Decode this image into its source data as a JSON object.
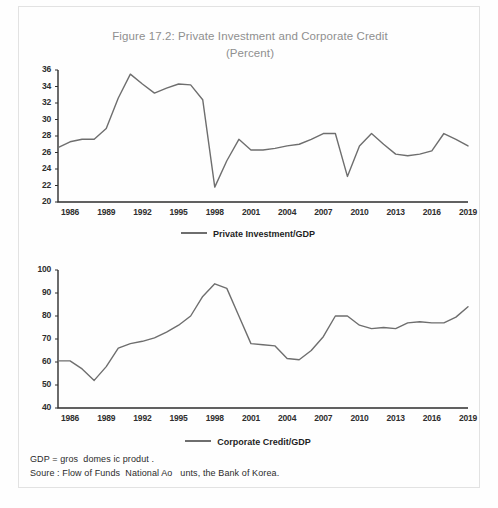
{
  "figure": {
    "title_line1": "Figure 17.2: Private Investment and Corporate Credit",
    "title_line2": "(Percent)",
    "notes": [
      "GDP = gros  domes ic produt .",
      "Soure : Flow of Funds  National Ao   unts, the Bank of Korea."
    ]
  },
  "style": {
    "line_color": "#6e6e6e",
    "axis_color": "#2e2e2e",
    "title_color": "#8f8f8f",
    "text_color": "#2b2b2b",
    "background": "#fefefe"
  },
  "chart_data": [
    {
      "type": "line",
      "id": "private-investment",
      "title": "Private Investment/GDP",
      "xlabel": "",
      "ylabel": "",
      "ylim": [
        20,
        36
      ],
      "yticks": [
        20,
        22,
        24,
        26,
        28,
        30,
        32,
        34,
        36
      ],
      "xlim": [
        1985,
        2019
      ],
      "xticks": [
        1986,
        1989,
        1992,
        1995,
        1998,
        2001,
        2004,
        2007,
        2010,
        2013,
        2016,
        2019
      ],
      "grid": false,
      "legend_position": "bottom-center",
      "legend": [
        "Private Investment/GDP"
      ],
      "series": [
        {
          "name": "Private Investment/GDP",
          "x": [
            1985,
            1986,
            1987,
            1988,
            1989,
            1990,
            1991,
            1992,
            1993,
            1994,
            1995,
            1996,
            1997,
            1998,
            1999,
            2000,
            2001,
            2002,
            2003,
            2004,
            2005,
            2006,
            2007,
            2008,
            2009,
            2010,
            2011,
            2012,
            2013,
            2014,
            2015,
            2016,
            2017,
            2018,
            2019
          ],
          "values": [
            26.6,
            27.3,
            27.6,
            27.6,
            28.9,
            32.6,
            35.5,
            34.3,
            33.2,
            33.8,
            34.3,
            34.2,
            32.4,
            21.8,
            25.0,
            27.6,
            26.3,
            26.3,
            26.5,
            26.8,
            27.0,
            27.6,
            28.3,
            28.3,
            23.1,
            26.8,
            28.3,
            27.0,
            25.8,
            25.6,
            25.8,
            26.2,
            28.3,
            27.6,
            26.8
          ]
        }
      ]
    },
    {
      "type": "line",
      "id": "corporate-credit",
      "title": "Corporate Credit/GDP",
      "xlabel": "",
      "ylabel": "",
      "ylim": [
        40,
        100
      ],
      "yticks": [
        40,
        50,
        60,
        70,
        80,
        90,
        100
      ],
      "xlim": [
        1985,
        2019
      ],
      "xticks": [
        1986,
        1989,
        1992,
        1995,
        1998,
        2001,
        2004,
        2007,
        2010,
        2013,
        2016,
        2019
      ],
      "grid": false,
      "legend_position": "bottom-center",
      "legend": [
        "Corporate Credit/GDP"
      ],
      "series": [
        {
          "name": "Corporate Credit/GDP",
          "x": [
            1985,
            1986,
            1987,
            1988,
            1989,
            1990,
            1991,
            1992,
            1993,
            1994,
            1995,
            1996,
            1997,
            1998,
            1999,
            2000,
            2001,
            2002,
            2003,
            2004,
            2005,
            2006,
            2007,
            2008,
            2009,
            2010,
            2011,
            2012,
            2013,
            2014,
            2015,
            2016,
            2017,
            2018,
            2019
          ],
          "values": [
            60.5,
            60.5,
            57.0,
            52.0,
            58.0,
            66.0,
            68.0,
            69.0,
            70.5,
            73.0,
            76.0,
            80.0,
            88.5,
            94.0,
            92.0,
            80.0,
            68.0,
            67.5,
            67.0,
            61.5,
            61.0,
            65.0,
            71.0,
            80.0,
            80.0,
            76.0,
            74.5,
            75.0,
            74.5,
            77.0,
            77.5,
            77.0,
            77.0,
            79.5,
            84.0
          ]
        }
      ]
    }
  ]
}
